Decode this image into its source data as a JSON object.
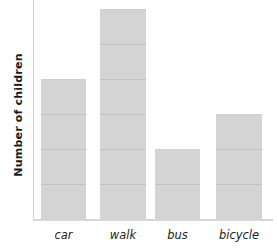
{
  "chart_data": {
    "type": "bar",
    "title": "",
    "xlabel": "",
    "ylabel": "Number of children",
    "categories": [
      "car",
      "walk",
      "bus",
      "bicycle"
    ],
    "values": [
      4,
      6,
      2,
      3
    ],
    "ylim": [
      0,
      6
    ],
    "grid": false,
    "legend": null,
    "bar_color": "#d3d3d3",
    "segment_line_color": "#c2c2c2",
    "axis_color": "#d4d4d4"
  },
  "layout": {
    "unit_px": 35,
    "baseline_y": 219,
    "bars": [
      {
        "left": 41,
        "width": 45
      },
      {
        "left": 100,
        "width": 46
      },
      {
        "left": 155,
        "width": 45
      },
      {
        "left": 216,
        "width": 46
      }
    ]
  }
}
